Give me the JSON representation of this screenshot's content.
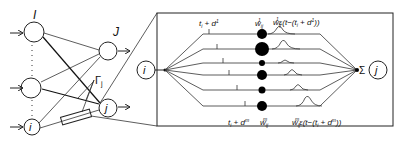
{
  "network": {
    "layer_I_label": "I",
    "layer_J_label": "J",
    "neuron_i_label": "i",
    "neuron_j_label": "j",
    "gamma_label": "Γ",
    "gamma_sub": "j"
  },
  "detail": {
    "input_neuron": "i",
    "output_neuron": "j",
    "sum_symbol": "Σ",
    "top_delay_label_main": "t",
    "top_delay_label_sub": "i",
    "top_delay_label_rest": " + d",
    "top_delay_label_sup": "1",
    "bottom_delay_label_main": "t",
    "bottom_delay_label_sub": "i",
    "bottom_delay_label_rest": " + d",
    "bottom_delay_label_sup": "m",
    "top_weight_main": "w",
    "top_weight_sub": "ij",
    "top_weight_sup": "1",
    "bottom_weight_main": "w",
    "bottom_weight_sub": "ij",
    "bottom_weight_sup": "m",
    "top_psp_label": "w",
    "top_psp_sub": "ij",
    "top_psp_sup": "1",
    "top_psp_rest": "ε(t−(t",
    "top_psp_rest_sub": "i",
    "top_psp_rest2": " + d",
    "top_psp_rest_sup": "1",
    "top_psp_end": "))",
    "bottom_psp_label": "w",
    "bottom_psp_sub": "ij",
    "bottom_psp_sup": "m",
    "bottom_psp_rest": "ε(t−(t",
    "bottom_psp_rest_sub": "i",
    "bottom_psp_rest2": " + d",
    "bottom_psp_rest_sup": "m",
    "bottom_psp_end": "))"
  }
}
